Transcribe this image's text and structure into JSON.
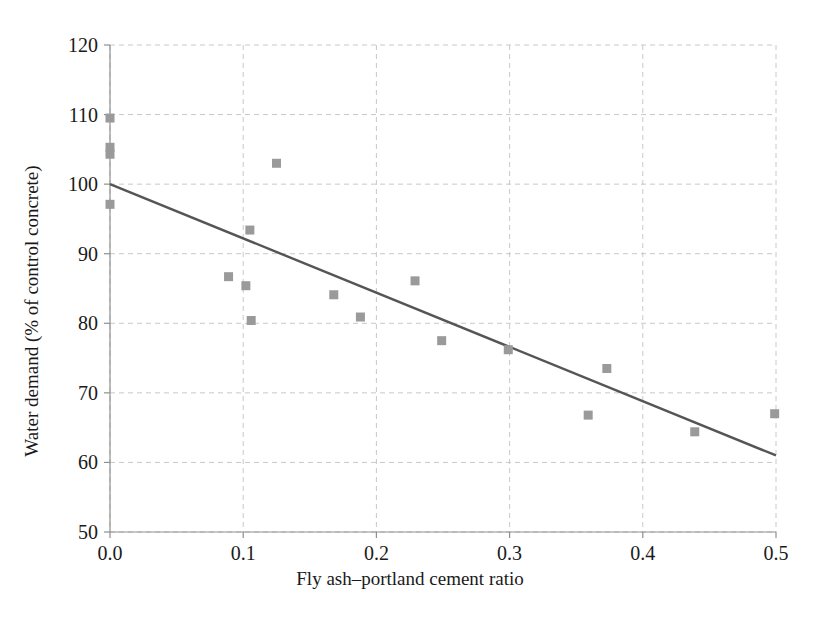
{
  "chart_data": {
    "type": "scatter",
    "title": "",
    "xlabel": "Fly ash–portland cement ratio",
    "ylabel": "Water demand (% of control concrete)",
    "xlim": [
      0.0,
      0.5
    ],
    "ylim": [
      50,
      120
    ],
    "xticks": [
      0.0,
      0.1,
      0.2,
      0.3,
      0.4,
      0.5
    ],
    "xticklabels": [
      "0.0",
      "0.1",
      "0.2",
      "0.3",
      "0.4",
      "0.5"
    ],
    "yticks": [
      50,
      60,
      70,
      80,
      90,
      100,
      110,
      120
    ],
    "yticklabels": [
      "50",
      "60",
      "70",
      "80",
      "90",
      "100",
      "110",
      "120"
    ],
    "grid": true,
    "grid_style": "dashed",
    "grid_color": "#c8c8c8",
    "legend": null,
    "marker": "square",
    "marker_color": "#9a9a9a",
    "marker_size": 9,
    "points": [
      {
        "x": 0.0,
        "y": 109.5
      },
      {
        "x": 0.0,
        "y": 105.3
      },
      {
        "x": 0.0,
        "y": 104.3
      },
      {
        "x": 0.0,
        "y": 97.1
      },
      {
        "x": 0.089,
        "y": 86.7
      },
      {
        "x": 0.102,
        "y": 85.4
      },
      {
        "x": 0.105,
        "y": 93.4
      },
      {
        "x": 0.106,
        "y": 80.4
      },
      {
        "x": 0.125,
        "y": 103.0
      },
      {
        "x": 0.168,
        "y": 84.1
      },
      {
        "x": 0.188,
        "y": 80.9
      },
      {
        "x": 0.229,
        "y": 86.1
      },
      {
        "x": 0.249,
        "y": 77.5
      },
      {
        "x": 0.299,
        "y": 76.2
      },
      {
        "x": 0.373,
        "y": 73.5
      },
      {
        "x": 0.359,
        "y": 66.8
      },
      {
        "x": 0.439,
        "y": 64.4
      },
      {
        "x": 0.499,
        "y": 67.0
      }
    ],
    "trendline": {
      "type": "line",
      "color": "#555555",
      "width": 2.4,
      "x": [
        0.0,
        0.5
      ],
      "y": [
        100.0,
        61.0
      ],
      "intercept": 100.0,
      "slope": -78.0
    }
  }
}
